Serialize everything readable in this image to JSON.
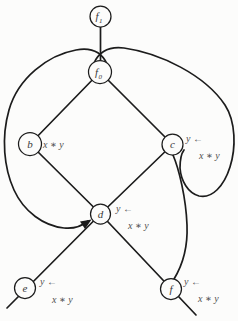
{
  "figure": {
    "background": "#fcfcfb",
    "stroke_color": "#1c1c1c",
    "node_fill": "#fcfcfb",
    "node_text_color": "#3a3a3a",
    "annotation_color": "#4f4f4f",
    "nodes": [
      {
        "id": "f1",
        "label": "f",
        "subscript": "1",
        "x": 100.5,
        "y": 16.5,
        "r": 10.5
      },
      {
        "id": "f0",
        "label": "f",
        "subscript": "0",
        "x": 100,
        "y": 72,
        "r": 11.5
      },
      {
        "id": "b",
        "label": "b",
        "subscript": "",
        "x": 30,
        "y": 144,
        "r": 11.5
      },
      {
        "id": "c",
        "label": "c",
        "subscript": "",
        "x": 172.5,
        "y": 144.5,
        "r": 10.5
      },
      {
        "id": "d",
        "label": "d",
        "subscript": "",
        "x": 100.5,
        "y": 214,
        "r": 10
      },
      {
        "id": "e",
        "label": "e",
        "subscript": "",
        "x": 25,
        "y": 288,
        "r": 10.5
      },
      {
        "id": "f",
        "label": "f",
        "subscript": "",
        "x": 171,
        "y": 289,
        "r": 10.5
      }
    ],
    "edges": [
      {
        "name": "edge-f1-f0",
        "d": "M 100.5 27 L 100.5 61"
      },
      {
        "name": "edge-f0-b",
        "d": "M 100 72 L 30 144"
      },
      {
        "name": "edge-f0-c",
        "d": "M 100 72 L 172.5 144.5"
      },
      {
        "name": "edge-b-d",
        "d": "M 30 144 L 100.5 214"
      },
      {
        "name": "edge-c-d",
        "d": "M 172.5 144.5 L 100.5 214"
      },
      {
        "name": "edge-d-e-extended",
        "d": "M 100.5 214 L 7 308"
      },
      {
        "name": "edge-d-f-extended",
        "d": "M 100.5 214 L 196 315"
      },
      {
        "name": "loop-f0-left-to-d",
        "d": "M 107 64 C 102 53 92 47 76 50 C 48 55 18 78 9 110 C 1 138 4 168 14 190 C 24 212 44 226 64 228 C 74 229 82 226 88 221"
      },
      {
        "name": "loop-f0-right-to-c",
        "d": "M 94 63 C 99 52 108 46 124 48 C 160 53 205 75 225 105 C 236 122 236 148 230 167 C 224 186 212 199 199 196 C 188 193 181 181 180 168 C 180 160 181 154 184 150"
      },
      {
        "name": "curve-c-to-f",
        "d": "M 173 155 C 179 169 186 198 187 225 C 188 249 182 266 174 279"
      }
    ],
    "arrowheads": [
      {
        "name": "arrowhead-at-d",
        "points": "91.5,219.5 85,229 80,221.5"
      }
    ],
    "annotations": [
      {
        "name": "label-b-op",
        "text": "x ∗ y",
        "x": 43,
        "y": 148
      },
      {
        "name": "label-c-assign",
        "text": "y ←",
        "x": 186,
        "y": 142
      },
      {
        "name": "label-c-op",
        "text": "x ∗ y",
        "x": 199,
        "y": 159
      },
      {
        "name": "label-d-assign",
        "text": "y ←",
        "x": 116,
        "y": 212
      },
      {
        "name": "label-d-op",
        "text": "x ∗ y",
        "x": 128,
        "y": 229
      },
      {
        "name": "label-e-assign",
        "text": "y ←",
        "x": 40,
        "y": 285
      },
      {
        "name": "label-e-op",
        "text": "x ∗ y",
        "x": 52,
        "y": 303
      },
      {
        "name": "label-f-assign",
        "text": "y ←",
        "x": 184,
        "y": 285
      },
      {
        "name": "label-f-op",
        "text": "x ∗ y",
        "x": 198,
        "y": 302
      }
    ]
  }
}
